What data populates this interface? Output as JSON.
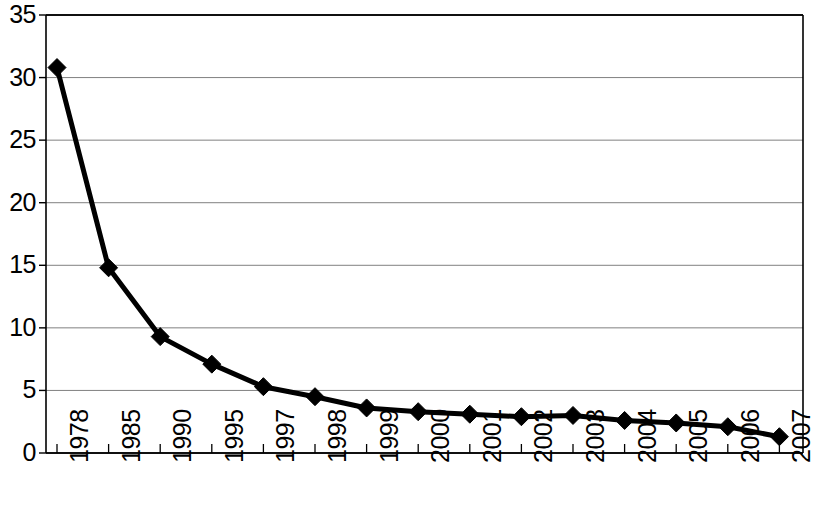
{
  "chart_data": {
    "type": "line",
    "title": "",
    "subtitle": "",
    "xlabel": "",
    "ylabel": "",
    "categories": [
      "1978",
      "1985",
      "1990",
      "1995",
      "1997",
      "1998",
      "1999",
      "2000",
      "2001",
      "2002",
      "2003",
      "2004",
      "2005",
      "2006",
      "2007"
    ],
    "values": [
      30.8,
      14.8,
      9.3,
      7.1,
      5.3,
      4.5,
      3.6,
      3.3,
      3.1,
      2.9,
      3.0,
      2.6,
      2.4,
      2.1,
      1.3
    ],
    "series": [
      {
        "name": "",
        "values": [
          30.8,
          14.8,
          9.3,
          7.1,
          5.3,
          4.5,
          3.6,
          3.3,
          3.1,
          2.9,
          3.0,
          2.6,
          2.4,
          2.1,
          1.3
        ]
      }
    ],
    "ylim": [
      0,
      35
    ],
    "y_ticks": [
      0,
      5,
      10,
      15,
      20,
      25,
      30,
      35
    ],
    "y_tick_labels": [
      "0",
      "5",
      "10",
      "15",
      "20",
      "25",
      "30",
      "35"
    ],
    "x_tick_labels": [
      "1978",
      "1985",
      "1990",
      "1995",
      "1997",
      "1998",
      "1999",
      "2000",
      "2001",
      "2002",
      "2003",
      "2004",
      "2005",
      "2006",
      "2007"
    ],
    "grid": true,
    "grid_axis": "y",
    "legend": false,
    "legend_position": "none",
    "marker": "diamond",
    "line_color": "#000000",
    "marker_color": "#000000",
    "grid_color": "#808080",
    "axis_color": "#000000",
    "background_color": "#ffffff",
    "line_width": 5,
    "marker_size": 9,
    "x_label_rotation": -90
  },
  "layout": {
    "plot_left": 46,
    "plot_right": 803,
    "plot_top": 15,
    "plot_bottom": 453,
    "first_point_x": 57,
    "point_spacing": 51.6,
    "x_label_top": 463
  }
}
